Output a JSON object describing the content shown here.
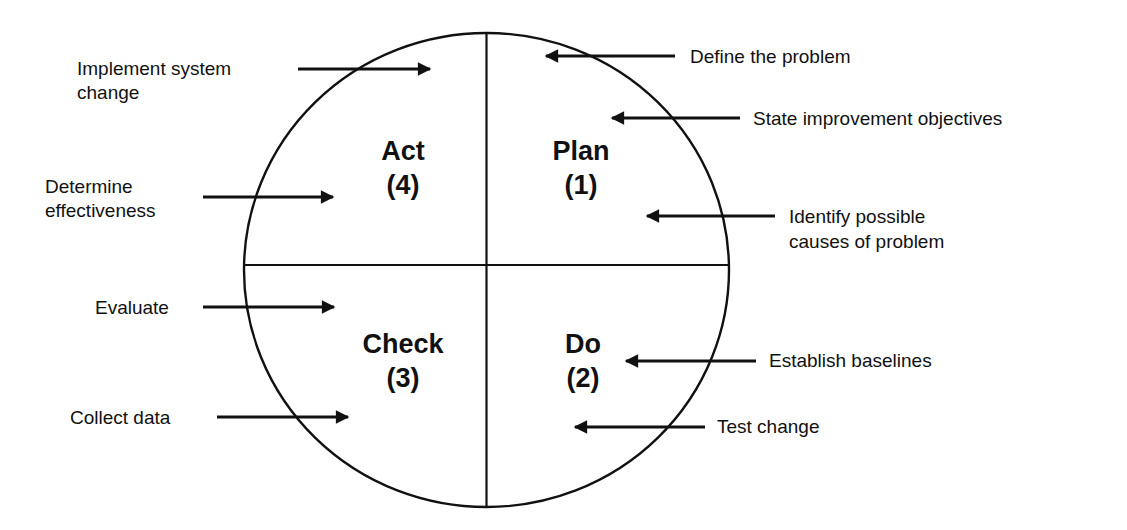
{
  "diagram": {
    "type": "PDCA cycle",
    "quadrants": [
      {
        "id": "plan",
        "name": "Plan",
        "number": "(1)"
      },
      {
        "id": "do",
        "name": "Do",
        "number": "(2)"
      },
      {
        "id": "check",
        "name": "Check",
        "number": "(3)"
      },
      {
        "id": "act",
        "name": "Act",
        "number": "(4)"
      }
    ],
    "annotations": {
      "plan": [
        {
          "lines": [
            "Define the problem"
          ]
        },
        {
          "lines": [
            "State improvement objectives"
          ]
        },
        {
          "lines": [
            "Identify possible",
            "causes of problem"
          ]
        }
      ],
      "do": [
        {
          "lines": [
            "Establish baselines"
          ]
        },
        {
          "lines": [
            "Test change"
          ]
        }
      ],
      "check": [
        {
          "lines": [
            "Evaluate"
          ]
        },
        {
          "lines": [
            "Collect data"
          ]
        }
      ],
      "act": [
        {
          "lines": [
            "Implement system",
            "change"
          ]
        },
        {
          "lines": [
            "Determine",
            "effectiveness"
          ]
        }
      ]
    },
    "colors": {
      "ink": "#111111",
      "background": "#ffffff"
    }
  }
}
